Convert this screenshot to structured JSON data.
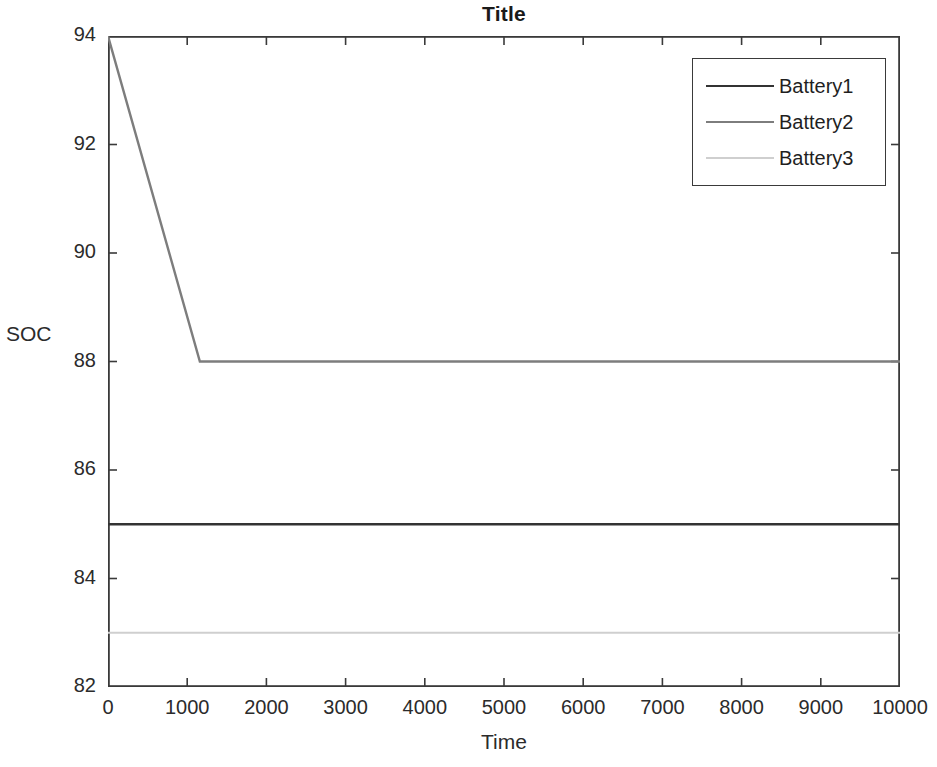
{
  "chart_data": {
    "type": "line",
    "title": "Title",
    "xlabel": "Time",
    "ylabel": "SOC",
    "xlim": [
      0,
      10000
    ],
    "ylim": [
      82,
      94
    ],
    "grid": false,
    "legend_position": "top-right",
    "xticks": [
      0,
      1000,
      2000,
      3000,
      4000,
      5000,
      6000,
      7000,
      8000,
      9000,
      10000
    ],
    "xtick_labels": [
      "0",
      "1000",
      "2000",
      "3000",
      "4000",
      "5000",
      "6000",
      "7000",
      "8000",
      "9000",
      "10000"
    ],
    "yticks": [
      82,
      84,
      86,
      88,
      90,
      92,
      94
    ],
    "ytick_labels": [
      "82",
      "84",
      "86",
      "88",
      "90",
      "92",
      "94"
    ],
    "series": [
      {
        "name": "Battery1",
        "color": "#333333",
        "width": 2.6,
        "x": [
          0,
          10000
        ],
        "y": [
          85,
          85
        ]
      },
      {
        "name": "Battery2",
        "color": "#7d7d7d",
        "width": 2.4,
        "x": [
          0,
          1160,
          10000
        ],
        "y": [
          94,
          88,
          88
        ]
      },
      {
        "name": "Battery3",
        "color": "#cfcfcf",
        "width": 2.2,
        "x": [
          0,
          10000
        ],
        "y": [
          83,
          83
        ]
      }
    ]
  },
  "axes": {
    "frame_color": "#3a3a3a"
  },
  "legend": {
    "entries": [
      {
        "label": "Battery1"
      },
      {
        "label": "Battery2"
      },
      {
        "label": "Battery3"
      }
    ]
  }
}
